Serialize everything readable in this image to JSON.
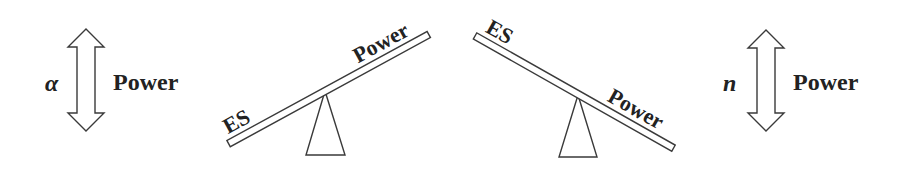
{
  "diagram": {
    "left_panel": {
      "symbol": "α",
      "label": "Power",
      "arrow": "double-headed-vertical-arrow"
    },
    "seesaw_left": {
      "low_end_label": "ES",
      "high_end_label": "Power"
    },
    "seesaw_right": {
      "high_end_label": "ES",
      "low_end_label": "Power"
    },
    "right_panel": {
      "symbol": "n",
      "label": "Power",
      "arrow": "double-headed-vertical-arrow"
    },
    "colors": {
      "stroke": "#3a3a3a",
      "text": "#222222",
      "background": "#ffffff"
    }
  }
}
